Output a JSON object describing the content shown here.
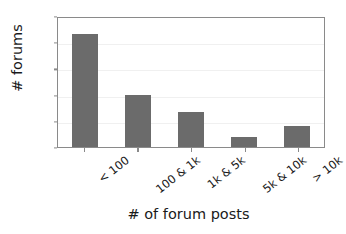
{
  "chart_data": {
    "type": "bar",
    "title": "",
    "categories": [
      "< 100",
      "100 & 1k",
      "1k & 5k",
      "5k & 10k",
      "> 10k"
    ],
    "values": [
      86,
      40,
      27,
      8,
      16
    ],
    "xlabel": "# of forum posts",
    "ylabel": "# forums",
    "ylim": [
      0,
      100
    ],
    "yticks": [
      "0",
      "20",
      "40",
      "60",
      "80",
      "100"
    ],
    "ytick_values": [
      0,
      20,
      40,
      60,
      80,
      100
    ],
    "grid": true,
    "legend": "none",
    "bar_color": "#6b6b6b",
    "background_color": "#ffffff",
    "axis_color": "#8a8a8a",
    "gridline_color": "#f0f0f0",
    "text_color": "#1a1a1a"
  }
}
